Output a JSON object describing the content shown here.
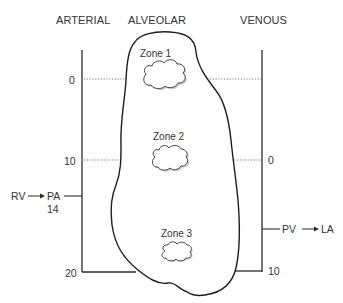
{
  "headers": {
    "arterial": "ARTERIAL",
    "alveolar": "ALVEOLAR",
    "venous": "VENOUS"
  },
  "zones": [
    {
      "label": "Zone 1"
    },
    {
      "label": "Zone 2"
    },
    {
      "label": "Zone 3"
    }
  ],
  "arterial_scale": {
    "ticks": [
      "0",
      "10",
      "20"
    ],
    "inflow": {
      "from": "RV",
      "to": "PA",
      "value": "14"
    }
  },
  "venous_scale": {
    "ticks": [
      "0",
      "10"
    ],
    "outflow": {
      "from": "PV",
      "to": "LA"
    }
  },
  "colors": {
    "line": "#2a2a2a",
    "dotted": "#555555",
    "cloud_shadow": "#bdbdbd"
  }
}
